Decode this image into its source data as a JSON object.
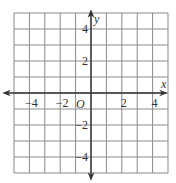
{
  "chart_data": {
    "type": "coordinate-grid",
    "title": "",
    "xlabel": "x",
    "ylabel": "y",
    "origin_label": "O",
    "xlim": [
      -5,
      5
    ],
    "ylim": [
      -5,
      5
    ],
    "grid": true,
    "grid_step": 1,
    "x_ticks": [
      {
        "value": -4,
        "label": "−4"
      },
      {
        "value": -2,
        "label": "−2"
      },
      {
        "value": 2,
        "label": "2"
      },
      {
        "value": 4,
        "label": "4"
      }
    ],
    "y_ticks": [
      {
        "value": 4,
        "label": "4"
      },
      {
        "value": 2,
        "label": "2"
      },
      {
        "value": -2,
        "label": "−2"
      },
      {
        "value": -4,
        "label": "−4"
      }
    ],
    "series": []
  },
  "colors": {
    "grid": "#8a8a8a",
    "axis": "#333333",
    "background": "#ffffff"
  }
}
